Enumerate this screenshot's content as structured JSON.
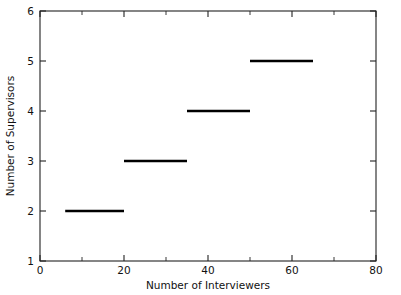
{
  "chart_data": {
    "type": "line",
    "subtype": "step",
    "title": "",
    "xlabel": "Number of Interviewers",
    "ylabel": "Number of Supervisors",
    "xlim": [
      0,
      80
    ],
    "ylim": [
      1,
      6
    ],
    "grid": false,
    "legend": false,
    "x_major_ticks": [
      0,
      20,
      40,
      60,
      80
    ],
    "x_major_tick_labels": [
      "0",
      "20",
      "40",
      "60",
      "80"
    ],
    "x_minor_ticks": [
      10,
      30,
      50,
      70
    ],
    "y_major_ticks": [
      1,
      2,
      3,
      4,
      5,
      6
    ],
    "y_major_tick_labels": [
      "1",
      "2",
      "3",
      "4",
      "5",
      "6"
    ],
    "y_minor_ticks": [],
    "series": [
      {
        "name": "Supervisors required",
        "color": "#000000",
        "segments": [
          {
            "x_start": 6,
            "x_end": 20,
            "y": 2
          },
          {
            "x_start": 20,
            "x_end": 35,
            "y": 3
          },
          {
            "x_start": 35,
            "x_end": 50,
            "y": 4
          },
          {
            "x_start": 50,
            "x_end": 65,
            "y": 5
          }
        ]
      }
    ]
  },
  "plot": {
    "box_left": 40,
    "box_right": 376,
    "box_top": 11,
    "box_bottom": 261,
    "tick_len_major": 6,
    "tick_len_minor": 4
  }
}
